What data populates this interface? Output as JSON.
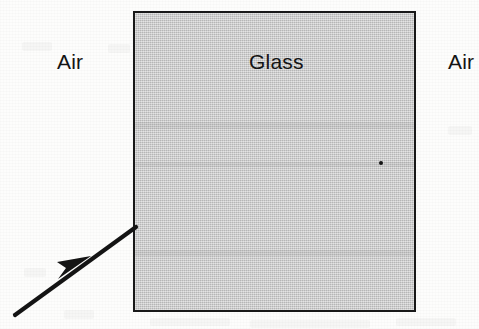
{
  "figure": {
    "type": "optics-refraction-diagram",
    "canvas": {
      "width": 479,
      "height": 329
    },
    "background_color": "#fdfdfc"
  },
  "labels": {
    "air_left": "Air",
    "glass": "Glass",
    "air_right": "Air"
  },
  "regions": [
    {
      "name": "air-left",
      "label": "Air",
      "medium": "air",
      "fill_color": "#fdfdfc"
    },
    {
      "name": "glass-slab",
      "label": "Glass",
      "medium": "glass",
      "fill_color": "#c9c9c9",
      "border_color": "#191919",
      "border_width_px": 2.5,
      "rect": {
        "x": 133,
        "y": 11,
        "width": 283,
        "height": 301
      }
    },
    {
      "name": "air-right",
      "label": "Air",
      "medium": "air",
      "fill_color": "#fdfdfc"
    }
  ],
  "ray": {
    "name": "incident-ray",
    "color": "#141414",
    "stroke_width_px": 4,
    "start": {
      "x": 15,
      "y": 315
    },
    "end": {
      "x": 136,
      "y": 227
    },
    "direction": "up-right",
    "arrowhead": {
      "name": "arrowhead",
      "position": {
        "x": 73,
        "y": 270
      },
      "style": "filled-triangle",
      "points_toward": "glass-surface"
    }
  },
  "markers": [
    {
      "name": "glass-point",
      "shape": "dot",
      "color": "#141414",
      "position": {
        "x": 381,
        "y": 163
      },
      "radius_px": 2
    }
  ],
  "artifacts": {
    "smudges": [
      {
        "x": 22,
        "y": 42,
        "w": 30,
        "h": 9
      },
      {
        "x": 108,
        "y": 44,
        "w": 22,
        "h": 9
      },
      {
        "x": 448,
        "y": 126,
        "w": 24,
        "h": 9
      },
      {
        "x": 24,
        "y": 268,
        "w": 22,
        "h": 9
      },
      {
        "x": 64,
        "y": 310,
        "w": 30,
        "h": 9
      },
      {
        "x": 150,
        "y": 318,
        "w": 80,
        "h": 8
      },
      {
        "x": 250,
        "y": 320,
        "w": 120,
        "h": 8
      },
      {
        "x": 396,
        "y": 318,
        "w": 60,
        "h": 8
      }
    ],
    "slab_bands": [
      {
        "y": 120,
        "h": 7
      },
      {
        "y": 160,
        "h": 5
      },
      {
        "y": 248,
        "h": 6
      }
    ]
  }
}
